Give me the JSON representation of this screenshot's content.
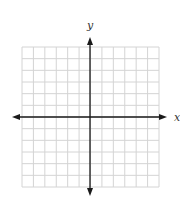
{
  "chart_data": {
    "type": "scatter",
    "title": "",
    "xlabel": "x",
    "ylabel": "y",
    "grid": true,
    "grid_cells_x": 12,
    "grid_cells_y": 12,
    "xlim": [
      -6,
      6
    ],
    "ylim": [
      -6,
      6
    ],
    "series": [],
    "tick_labels": [],
    "colors": {
      "grid": "#d4d4d4",
      "axis": "#1a1a1a"
    }
  },
  "labels": {
    "x_axis": "x",
    "y_axis": "y"
  }
}
